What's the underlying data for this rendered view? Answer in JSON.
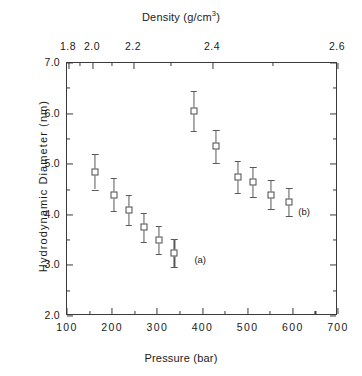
{
  "chart_data": {
    "type": "scatter",
    "title": "",
    "xlabel": "Pressure (bar)",
    "ylabel": "Hydrodynamic  Diameter  (nm)",
    "top_axis_label_html": "Density  (g/cm<sup>3</sup>)",
    "top_axis_label": "Density (g/cm3)",
    "xlim": [
      100,
      700
    ],
    "ylim": [
      2.0,
      7.0
    ],
    "grid": false,
    "legend": "none",
    "marker_style": "open-square",
    "error_bars": "y",
    "x_ticks": [
      100,
      200,
      300,
      400,
      500,
      600,
      700
    ],
    "x_tick_labels": [
      "100",
      "200",
      "300",
      "400",
      "500",
      "600",
      "700"
    ],
    "x_minor_ticks": [
      150,
      250,
      350,
      450,
      550,
      650
    ],
    "y_ticks": [
      2.0,
      3.0,
      4.0,
      5.0,
      6.0,
      7.0
    ],
    "y_tick_labels": [
      "2.0",
      "3.0",
      "4.0",
      "5.0",
      "6.0",
      "7.0"
    ],
    "y_minor_ticks": [
      2.5,
      3.5,
      4.5,
      5.5,
      6.5
    ],
    "top_axis": {
      "label": "Density  (g/cm3)",
      "ticks": [
        {
          "value": 1.8,
          "label": "1.8",
          "px": 68
        },
        {
          "value": 1.9,
          "label": "",
          "px": 79
        },
        {
          "value": 2.0,
          "label": "2.0",
          "px": 92
        },
        {
          "value": 2.1,
          "label": "",
          "px": 111
        },
        {
          "value": 2.2,
          "label": "2.2",
          "px": 133
        },
        {
          "value": 2.3,
          "label": "",
          "px": 170
        },
        {
          "value": 2.4,
          "label": "2.4",
          "px": 212
        },
        {
          "value": 2.5,
          "label": "",
          "px": 272
        },
        {
          "value": 2.6,
          "label": "2.6",
          "px": 337
        }
      ]
    },
    "series": [
      {
        "name": "Hydrodynamic diameter vs pressure",
        "points": [
          {
            "x": 162,
            "y": 4.85,
            "yerr_low": 0.35,
            "yerr_high": 0.35
          },
          {
            "x": 204,
            "y": 4.4,
            "yerr_low": 0.32,
            "yerr_high": 0.32
          },
          {
            "x": 237,
            "y": 4.1,
            "yerr_low": 0.3,
            "yerr_high": 0.3
          },
          {
            "x": 270,
            "y": 3.75,
            "yerr_low": 0.28,
            "yerr_high": 0.28
          },
          {
            "x": 303,
            "y": 3.5,
            "yerr_low": 0.28,
            "yerr_high": 0.28
          },
          {
            "x": 338,
            "y": 3.25,
            "yerr_low": 0.28,
            "yerr_high": 0.28
          },
          {
            "x": 381,
            "y": 6.05,
            "yerr_low": 0.4,
            "yerr_high": 0.4
          },
          {
            "x": 430,
            "y": 5.35,
            "yerr_low": 0.33,
            "yerr_high": 0.33
          },
          {
            "x": 478,
            "y": 4.75,
            "yerr_low": 0.32,
            "yerr_high": 0.32
          },
          {
            "x": 512,
            "y": 4.65,
            "yerr_low": 0.3,
            "yerr_high": 0.3
          },
          {
            "x": 552,
            "y": 4.4,
            "yerr_low": 0.28,
            "yerr_high": 0.28
          },
          {
            "x": 592,
            "y": 4.25,
            "yerr_low": 0.28,
            "yerr_high": 0.28
          }
        ]
      }
    ],
    "annotations": [
      {
        "text": "(a)",
        "x": 395,
        "y": 3.12
      },
      {
        "text": "(b)",
        "x": 625,
        "y": 4.07
      }
    ]
  },
  "colors": {
    "axis": "#3a3a3a",
    "marker_edge": "#4a4a4a",
    "marker_face": "#ffffff",
    "errorbar": "#595959",
    "text": "#1a1a1a",
    "background": "#ffffff"
  }
}
